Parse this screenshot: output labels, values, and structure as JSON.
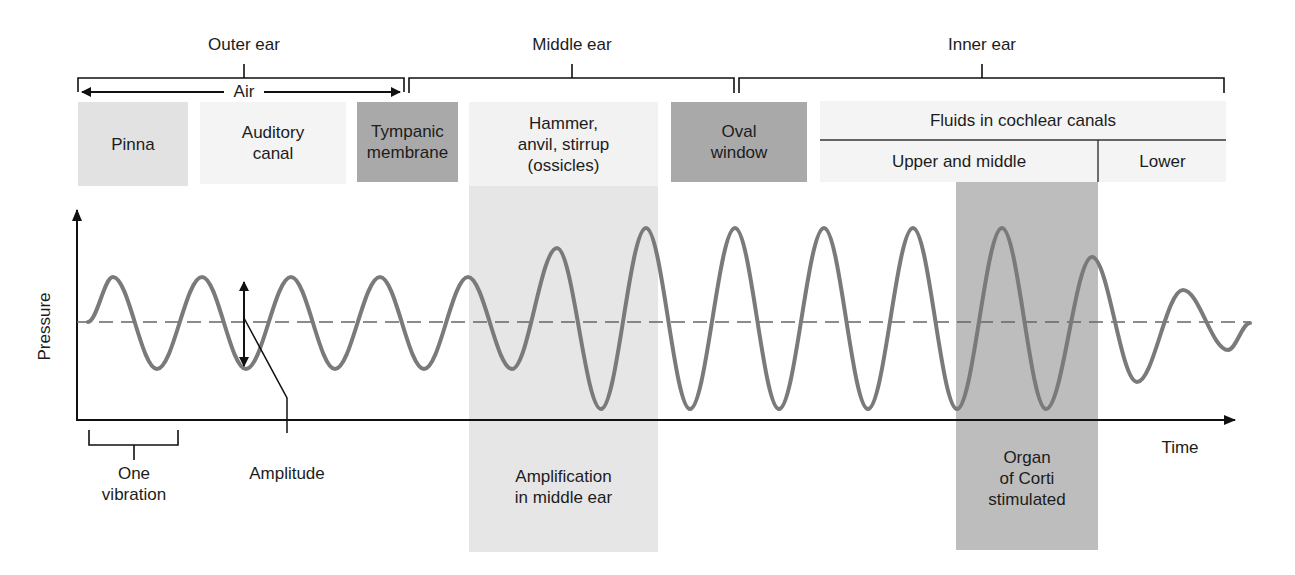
{
  "regions": [
    {
      "label": "Outer ear",
      "x1": 78,
      "x2": 404,
      "tick_x": 244
    },
    {
      "label": "Middle ear",
      "x1": 409,
      "x2": 734,
      "tick_x": 572
    },
    {
      "label": "Inner ear",
      "x1": 739,
      "x2": 1224,
      "tick_x": 982
    }
  ],
  "air": {
    "label": "Air",
    "x1": 80,
    "x2": 400,
    "y": 92
  },
  "structures": {
    "pinna": "Pinna",
    "auditory_canal": "Auditory\ncanal",
    "tympanic_membrane": "Tympanic\nmembrane",
    "ossicles": "Hammer,\nanvil, stirrup\n(ossicles)",
    "oval_window": "Oval\nwindow",
    "fluids": "Fluids in cochlear canals",
    "upper_middle": "Upper and middle",
    "lower": "Lower"
  },
  "axes": {
    "ylabel": "Pressure",
    "xlabel": "Time"
  },
  "annotations": {
    "one_vibration": "One\nvibration",
    "amplitude": "Amplitude",
    "amplification": "Amplification\nin middle ear",
    "organ_of_corti": "Organ\nof Corti\nstimulated"
  },
  "colors": {
    "wave": "#7a7a7a",
    "dark_box": "#a9a9a9",
    "medium_box": "#e2e2e2",
    "light_box": "#f4f4f4",
    "amplification_band": "#e6e6e6",
    "corti_band": "#bdbdbd",
    "line": "#111111"
  },
  "chart_data": {
    "type": "line",
    "title": "",
    "xlabel": "Time",
    "ylabel": "Pressure",
    "baseline_y_px": 322,
    "wave_extrema_px": [
      {
        "x": 88,
        "y": 322
      },
      {
        "x": 113,
        "y": 277
      },
      {
        "x": 157,
        "y": 369
      },
      {
        "x": 202,
        "y": 277
      },
      {
        "x": 246,
        "y": 369
      },
      {
        "x": 291,
        "y": 277
      },
      {
        "x": 335,
        "y": 369
      },
      {
        "x": 380,
        "y": 277
      },
      {
        "x": 424,
        "y": 369
      },
      {
        "x": 468,
        "y": 277
      },
      {
        "x": 512,
        "y": 369
      },
      {
        "x": 557,
        "y": 248
      },
      {
        "x": 601,
        "y": 409
      },
      {
        "x": 646,
        "y": 228
      },
      {
        "x": 690,
        "y": 409
      },
      {
        "x": 735,
        "y": 228
      },
      {
        "x": 779,
        "y": 409
      },
      {
        "x": 824,
        "y": 228
      },
      {
        "x": 868,
        "y": 409
      },
      {
        "x": 913,
        "y": 228
      },
      {
        "x": 957,
        "y": 409
      },
      {
        "x": 1002,
        "y": 228
      },
      {
        "x": 1046,
        "y": 409
      },
      {
        "x": 1092,
        "y": 257
      },
      {
        "x": 1137,
        "y": 382
      },
      {
        "x": 1183,
        "y": 290
      },
      {
        "x": 1228,
        "y": 350
      },
      {
        "x": 1250,
        "y": 323
      }
    ],
    "relative_amplitude": {
      "outer_ear": 1.0,
      "middle_ear_rise": [
        1.6,
        2.0
      ],
      "inner_ear": 2.0,
      "after_corti": [
        1.5,
        0.7,
        0.6
      ]
    }
  }
}
